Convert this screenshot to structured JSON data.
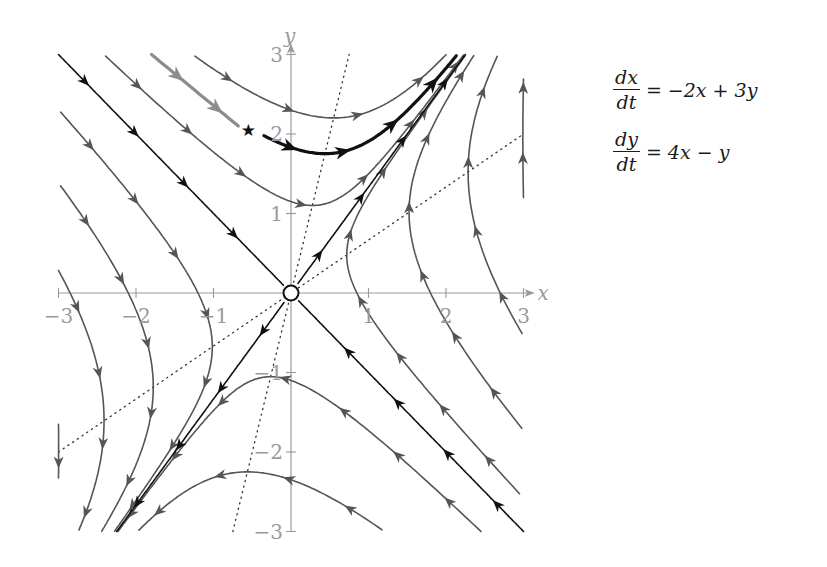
{
  "system": {
    "equations": [
      {
        "lhs_num": "dx",
        "lhs_den": "dt",
        "rhs": "= −2x + 3y"
      },
      {
        "lhs_num": "dy",
        "lhs_den": "dt",
        "rhs": "= 4x − y"
      }
    ],
    "matrix": [
      [
        -2,
        3
      ],
      [
        4,
        -1
      ]
    ],
    "eigenvalues": [
      2,
      -5
    ],
    "eigenvectors": {
      "unstable": [
        3,
        4
      ],
      "stable": [
        1,
        -1
      ]
    },
    "equilibrium": {
      "x": 0,
      "y": 0,
      "type": "saddle"
    }
  },
  "axes": {
    "x_label": "x",
    "y_label": "y",
    "x_range": [
      -3,
      3
    ],
    "y_range": [
      -3,
      3
    ],
    "x_ticks": [
      {
        "value": -3,
        "label": "−3"
      },
      {
        "value": -2,
        "label": "−2"
      },
      {
        "value": -1,
        "label": "−1"
      },
      {
        "value": 1,
        "label": "1"
      },
      {
        "value": 2,
        "label": "2"
      },
      {
        "value": 3,
        "label": "3"
      }
    ],
    "y_ticks": [
      {
        "value": 3,
        "label": "3"
      },
      {
        "value": 2,
        "label": "2"
      },
      {
        "value": 1,
        "label": "1"
      },
      {
        "value": -1,
        "label": "−1"
      },
      {
        "value": -2,
        "label": "−2"
      },
      {
        "value": -3,
        "label": "−3"
      }
    ]
  },
  "nullclines": [
    {
      "name": "x-nullcline",
      "equation": "y = 2x/3",
      "style": "dotted"
    },
    {
      "name": "y-nullcline",
      "equation": "y = 4x",
      "style": "dotted"
    }
  ],
  "marked_point": {
    "symbol": "★",
    "x": -0.55,
    "y": 2.05
  },
  "highlighted_trajectory": {
    "start": [
      -0.35,
      1.98
    ],
    "style": "thick-black"
  },
  "incoming_path": {
    "from": [
      -1.8,
      3.0
    ],
    "to": [
      -0.68,
      2.1
    ],
    "style": "thick-gray"
  },
  "colors": {
    "axis": "#9a9a9a",
    "trajectory": "#555555",
    "manifold": "#111111",
    "highlight": "#111111",
    "incoming": "#8c8c8c",
    "nullcline": "#333333"
  },
  "chart_data": {
    "type": "phase_portrait",
    "title": "",
    "xlabel": "x",
    "ylabel": "y",
    "xlim": [
      -3,
      3
    ],
    "ylim": [
      -3,
      3
    ],
    "grid": false,
    "system": "dx/dt = -2x + 3y, dy/dt = 4x - y",
    "separatrices": [
      {
        "name": "unstable manifold",
        "direction": [
          3,
          4
        ],
        "flow": "outward"
      },
      {
        "name": "stable manifold",
        "direction": [
          1,
          -1
        ],
        "flow": "inward"
      }
    ],
    "trajectory_seeds": [
      [
        0,
        2.3
      ],
      [
        0,
        1.15
      ],
      [
        0,
        -1.1
      ],
      [
        0,
        -2.35
      ],
      [
        -2.85,
        0
      ],
      [
        -2.1,
        0
      ],
      [
        -1.2,
        0
      ],
      [
        0.85,
        0
      ],
      [
        1.8,
        0
      ],
      [
        2.7,
        0
      ],
      [
        -3.0,
        -2.05
      ],
      [
        3.0,
        1.7
      ],
      [
        -0.35,
        1.98
      ]
    ]
  }
}
